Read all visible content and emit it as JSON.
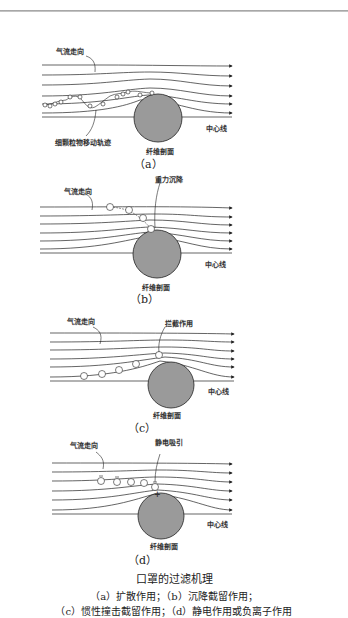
{
  "panels": [
    {
      "id": "a",
      "label": "（a）",
      "airflow_label": "气流走向",
      "centerline_label": "中心线",
      "fiber_label": "纤维剖面",
      "particle_label": "细颗粒物移动轨迹"
    },
    {
      "id": "b",
      "label": "（b）",
      "airflow_label": "气流走向",
      "centerline_label": "中心线",
      "fiber_label": "纤维剖面",
      "mechanism_label": "重力沉降"
    },
    {
      "id": "c",
      "label": "（c）",
      "airflow_label": "气流走向",
      "centerline_label": "中心线",
      "fiber_label": "纤维剖面",
      "mechanism_label": "拦截作用"
    },
    {
      "id": "d",
      "label": "（d）",
      "airflow_label": "气流走向",
      "centerline_label": "中心线",
      "fiber_label": "纤维剖面",
      "mechanism_label": "静电吸引",
      "particle_charge": "−",
      "fiber_charge": "+"
    }
  ],
  "caption": {
    "title": "口罩的过滤机理",
    "line1": "（a）扩散作用；（b）沉降截留作用；",
    "line2": "（c）惯性撞击截留作用；（d）静电作用或负离子作用"
  },
  "colors": {
    "fiber_fill": "#9a9a9a",
    "line": "#222222",
    "background": "#ffffff"
  }
}
